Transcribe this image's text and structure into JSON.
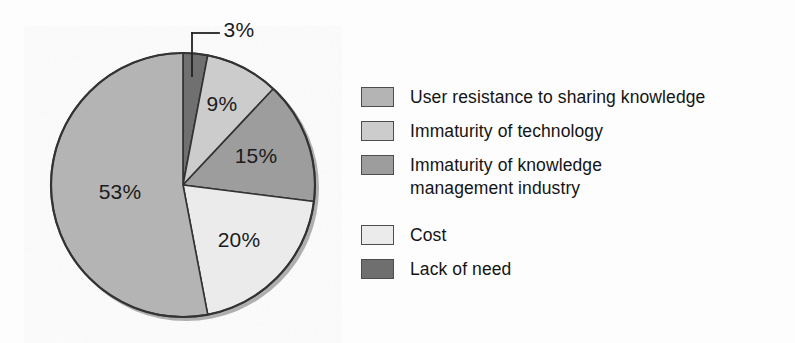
{
  "chart_data": {
    "type": "pie",
    "title": "",
    "subtitle": "",
    "xlabel": "",
    "ylabel": "",
    "grid": false,
    "legend_position": "right",
    "unit": "%",
    "start_angle_deg": 0,
    "direction": "clockwise",
    "categories": [
      "Lack of need",
      "Immaturity of technology",
      "Immaturity of knowledge management industry",
      "Cost",
      "User resistance to sharing knowledge"
    ],
    "values": [
      3,
      9,
      15,
      20,
      53
    ],
    "labels": [
      "3%",
      "9%",
      "15%",
      "20%",
      "53%"
    ],
    "colors": [
      "#6f6f6f",
      "#cccccc",
      "#9d9d9d",
      "#ebebeb",
      "#b4b4b4"
    ],
    "slices": [
      {
        "label": "3%",
        "value": 3,
        "category": "Lack of need",
        "color": "#6f6f6f",
        "label_x": 239,
        "label_y": 30,
        "callout": true
      },
      {
        "label": "9%",
        "value": 9,
        "category": "Immaturity of technology",
        "color": "#cccccc",
        "label_x": 222,
        "label_y": 104,
        "callout": false
      },
      {
        "label": "15%",
        "value": 15,
        "category": "Immaturity of knowledge management industry",
        "color": "#9d9d9d",
        "label_x": 256,
        "label_y": 156,
        "callout": false
      },
      {
        "label": "20%",
        "value": 20,
        "category": "Cost",
        "color": "#ebebeb",
        "label_x": 239,
        "label_y": 240,
        "callout": false
      },
      {
        "label": "53%",
        "value": 53,
        "category": "User resistance to sharing knowledge",
        "color": "#b4b4b4",
        "label_x": 120,
        "label_y": 192,
        "callout": false
      }
    ]
  },
  "legend": {
    "items": [
      {
        "label": "User resistance to sharing knowledge",
        "label_line2": "",
        "color": "#b4b4b4",
        "value": 53
      },
      {
        "label": "Immaturity of technology",
        "label_line2": "",
        "color": "#cccccc",
        "value": 9
      },
      {
        "label": "Immaturity of knowledge",
        "label_line2": "management industry",
        "color": "#9d9d9d",
        "value": 15
      },
      {
        "label": "Cost",
        "label_line2": "",
        "color": "#ebebeb",
        "value": 20
      },
      {
        "label": "Lack of need",
        "label_line2": "",
        "color": "#6f6f6f",
        "value": 3
      }
    ]
  },
  "style": {
    "outline_color": "#333333",
    "text_color": "#141414",
    "background": "#fdfdfd"
  }
}
